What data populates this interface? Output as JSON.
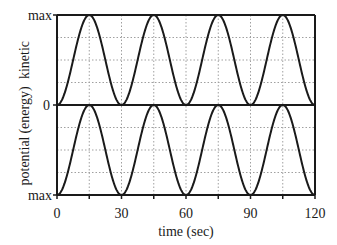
{
  "chart_data": {
    "type": "line",
    "title": "",
    "xlabel": "time (sec)",
    "ylabel": "potential   (energy)   kinetic",
    "xlim": [
      0,
      120
    ],
    "x_ticks": [
      0,
      30,
      60,
      90,
      120
    ],
    "x_minor_ticks": [
      15,
      45,
      75,
      105
    ],
    "grid": true,
    "panels": [
      {
        "name": "kinetic",
        "ylabel": "kinetic",
        "y_ticks": [
          "0",
          "max"
        ],
        "y_direction": "up",
        "x": [
          0,
          7.5,
          15,
          22.5,
          30,
          37.5,
          45,
          52.5,
          60,
          67.5,
          75,
          82.5,
          90,
          97.5,
          105,
          112.5,
          120
        ],
        "values": [
          0,
          0.5,
          1,
          0.5,
          0,
          0.5,
          1,
          0.5,
          0,
          0.5,
          1,
          0.5,
          0,
          0.5,
          1,
          0.5,
          0
        ],
        "formula": "sin^2(pi*t/30)"
      },
      {
        "name": "potential",
        "ylabel": "potential",
        "y_ticks": [
          "0",
          "max"
        ],
        "y_direction": "down",
        "x": [
          0,
          7.5,
          15,
          22.5,
          30,
          37.5,
          45,
          52.5,
          60,
          67.5,
          75,
          82.5,
          90,
          97.5,
          105,
          112.5,
          120
        ],
        "values": [
          1,
          0.5,
          0,
          0.5,
          1,
          0.5,
          0,
          0.5,
          1,
          0.5,
          0,
          0.5,
          1,
          0.5,
          0,
          0.5,
          1
        ],
        "formula": "cos^2(pi*t/30)"
      }
    ],
    "labels": {
      "top_max": "max",
      "mid_zero": "0",
      "bottom_max": "max",
      "y_kinetic": "kinetic",
      "y_energy": "(energy)",
      "y_potential": "potential",
      "x_ticks": [
        "0",
        "30",
        "60",
        "90",
        "120"
      ]
    },
    "colors": {
      "line": "#1a1a1a",
      "grid": "#a0a0a0",
      "axis": "#1a1a1a"
    }
  }
}
